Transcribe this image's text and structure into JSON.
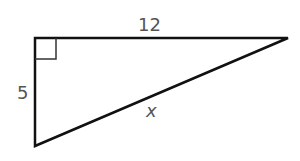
{
  "diagram": {
    "type": "right-triangle",
    "labels": {
      "top_leg": "12",
      "left_leg": "5",
      "hypotenuse": "x"
    },
    "right_angle_marker": true,
    "colors": {
      "stroke": "#111111",
      "label": "#555555",
      "background": "#ffffff"
    }
  }
}
